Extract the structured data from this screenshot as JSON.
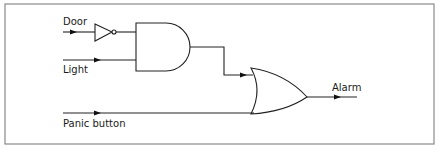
{
  "diagram": {
    "type": "logic-circuit",
    "inputs": [
      {
        "id": "door",
        "label": "Door"
      },
      {
        "id": "light",
        "label": "Light"
      },
      {
        "id": "panic",
        "label": "Panic button"
      }
    ],
    "outputs": [
      {
        "id": "alarm",
        "label": "Alarm"
      }
    ],
    "gates": [
      {
        "id": "not1",
        "type": "NOT",
        "inputs": [
          "door"
        ]
      },
      {
        "id": "and1",
        "type": "AND",
        "inputs": [
          "not1",
          "light"
        ]
      },
      {
        "id": "or1",
        "type": "OR",
        "inputs": [
          "and1",
          "panic"
        ],
        "output": "alarm"
      }
    ],
    "colors": {
      "line": "#222222",
      "frame": "#8a8a8a",
      "background": "#ffffff"
    }
  }
}
